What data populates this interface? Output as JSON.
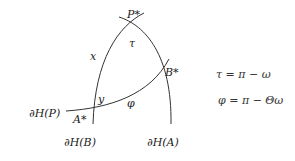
{
  "diagram": {
    "points": {
      "p_star": "P*",
      "a_star": "A*",
      "b_star": "B*"
    },
    "angles": {
      "tau": "τ",
      "phi": "φ",
      "x": "x",
      "y": "y"
    },
    "boundaries": {
      "h_p": "∂H(P)",
      "h_b": "∂H(B)",
      "h_a": "∂H(A)"
    },
    "equations": {
      "eq1": "τ = π − ω",
      "eq2": "φ = π − Θω"
    },
    "colors": {
      "stroke": "#333333",
      "text": "#222222",
      "background": "#ffffff"
    }
  }
}
